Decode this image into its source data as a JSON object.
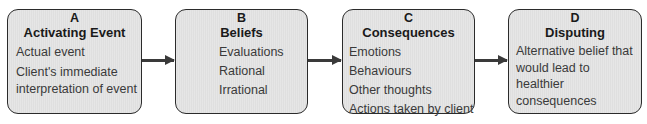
{
  "diagram": {
    "type": "flow",
    "boxes": [
      {
        "letter": "A",
        "title": "Activating Event",
        "items": [
          "Actual event",
          "Client's immediate interpretation of event"
        ]
      },
      {
        "letter": "B",
        "title": "Beliefs",
        "items": [
          "Evaluations",
          "Rational",
          "Irrational"
        ]
      },
      {
        "letter": "C",
        "title": "Consequences",
        "items": [
          "Emotions",
          "Behaviours",
          "Other thoughts",
          "Actions taken by client"
        ]
      },
      {
        "letter": "D",
        "title": "Disputing",
        "items": [
          "Alternative belief that would lead to healthier consequences"
        ]
      }
    ],
    "arrows": [
      {
        "from": "A",
        "to": "B"
      },
      {
        "from": "B",
        "to": "C"
      },
      {
        "from": "C",
        "to": "D"
      }
    ],
    "colors": {
      "box_fill": "#e3e3e3",
      "box_border": "#2b2b2b",
      "arrow": "#3a3a3a"
    }
  }
}
